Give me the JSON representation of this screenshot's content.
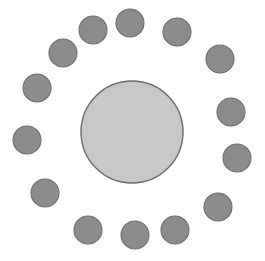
{
  "canvas": {
    "width": 265,
    "height": 261,
    "background": "#ffffff",
    "title": "hub-and-satellites ring diagram"
  },
  "palette": {
    "hub_fill": "#c8c8c8",
    "hub_stroke": "#6b6b6b",
    "satellite_fill": "#8c8c8c",
    "satellite_stroke": "#6e6e6e",
    "background": "#ffffff"
  },
  "chart_data": {
    "type": "scatter",
    "title": "",
    "xlabel": "",
    "ylabel": "",
    "xlim": [
      0,
      265
    ],
    "ylim": [
      0,
      261
    ],
    "grid": false,
    "legend": "none",
    "series": [
      {
        "name": "hub",
        "marker": "circle",
        "fill": "#c8c8c8",
        "stroke": "#6b6b6b",
        "stroke_width": 1.4,
        "points": [
          {
            "label": "hub",
            "cx": 132,
            "cy": 132,
            "r": 51
          }
        ]
      },
      {
        "name": "satellites",
        "marker": "circle",
        "fill": "#8c8c8c",
        "stroke": "#6e6e6e",
        "stroke_width": 1.1,
        "count": 14,
        "ring_radius": 108,
        "points": [
          {
            "label": "satellite-01",
            "cx": 130,
            "cy": 23,
            "r": 14
          },
          {
            "label": "satellite-02",
            "cx": 177,
            "cy": 32,
            "r": 14
          },
          {
            "label": "satellite-03",
            "cx": 220,
            "cy": 59,
            "r": 14
          },
          {
            "label": "satellite-04",
            "cx": 231,
            "cy": 112,
            "r": 14
          },
          {
            "label": "satellite-05",
            "cx": 237,
            "cy": 158,
            "r": 14
          },
          {
            "label": "satellite-06",
            "cx": 218,
            "cy": 207,
            "r": 14
          },
          {
            "label": "satellite-07",
            "cx": 175,
            "cy": 230,
            "r": 14
          },
          {
            "label": "satellite-08",
            "cx": 135,
            "cy": 235,
            "r": 14
          },
          {
            "label": "satellite-09",
            "cx": 88,
            "cy": 230,
            "r": 14
          },
          {
            "label": "satellite-10",
            "cx": 45,
            "cy": 193,
            "r": 14
          },
          {
            "label": "satellite-11",
            "cx": 27,
            "cy": 140,
            "r": 14
          },
          {
            "label": "satellite-12",
            "cx": 37,
            "cy": 88,
            "r": 14
          },
          {
            "label": "satellite-13",
            "cx": 63,
            "cy": 53,
            "r": 14
          },
          {
            "label": "satellite-14",
            "cx": 93,
            "cy": 30,
            "r": 14
          }
        ]
      }
    ]
  }
}
